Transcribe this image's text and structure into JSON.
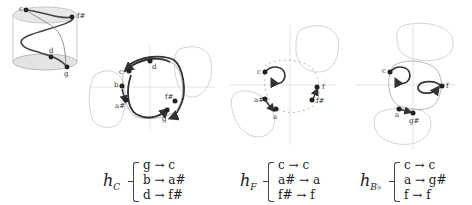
{
  "cylinder": {
    "labels": {
      "c": "c",
      "f_sharp": "f#",
      "d": "d",
      "g": "g"
    }
  },
  "panels": [
    {
      "id": "C",
      "points": {
        "c": "c",
        "d": "d",
        "b": "b",
        "a_sharp": "a#",
        "f_sharp": "f#",
        "g": "g"
      },
      "equation": {
        "symbol": "h",
        "subscript": "C",
        "rows": [
          "g → c",
          "b → a#",
          "d → f#"
        ]
      }
    },
    {
      "id": "F",
      "points": {
        "c": "c",
        "f": "f",
        "f_sharp": "f#",
        "a_sharp": "a#",
        "a": "a"
      },
      "equation": {
        "symbol": "h",
        "subscript": "F",
        "rows": [
          "c → c",
          "a# → a",
          "f# → f"
        ]
      }
    },
    {
      "id": "Bb",
      "points": {
        "c": "c",
        "f": "f",
        "a": "a",
        "g_sharp": "g#"
      },
      "equation": {
        "symbol": "h",
        "subscript": "B♭",
        "rows": [
          "c → c",
          "a → g#",
          "f → f"
        ]
      }
    }
  ],
  "colors": {
    "curve": "#333333",
    "blob": "#c8c8c8",
    "axis": "#cfcfcf",
    "dot": "#222222",
    "cylinder_fill": "#e6e6e6"
  }
}
